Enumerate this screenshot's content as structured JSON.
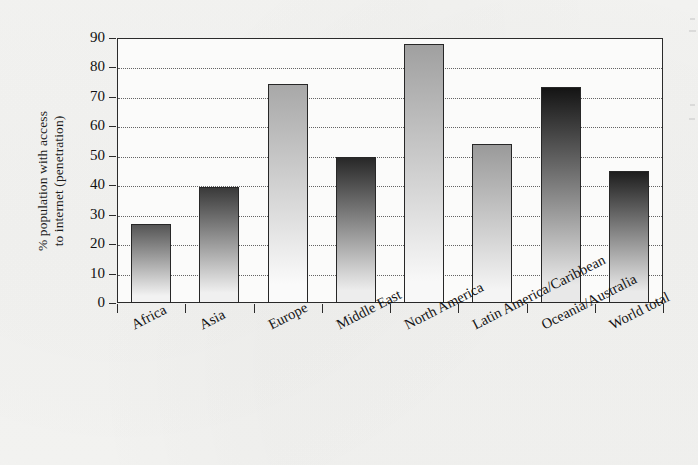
{
  "chart_data": {
    "type": "bar",
    "title": "",
    "xlabel": "",
    "ylabel": "% population with access to internet (penetration)",
    "ylabel_line1": "% population with access",
    "ylabel_line2": "to internet (penetration)",
    "categories": [
      "Africa",
      "Asia",
      "Europe",
      "Middle East",
      "North America",
      "Latin America/Caribbean",
      "Oceania/Australia",
      "World total"
    ],
    "values": [
      27,
      39.5,
      74.5,
      49.5,
      88,
      54,
      73.5,
      45
    ],
    "ylim": [
      0,
      90
    ],
    "ytick_values": [
      0,
      10,
      20,
      30,
      40,
      50,
      60,
      70,
      80,
      90
    ],
    "ytick_labels": [
      "0",
      "10",
      "20",
      "30",
      "40",
      "50",
      "60",
      "70",
      "80",
      "90"
    ],
    "grid": "horizontal-dotted",
    "legend": "none",
    "bar_fill": "vertical-gradient-dark-top-to-light-bottom",
    "bar_shades": [
      {
        "category": "Africa",
        "top": "#555555",
        "bottom": "#f2f2f2"
      },
      {
        "category": "Asia",
        "top": "#3a3a3a",
        "bottom": "#f0f0f0"
      },
      {
        "category": "Europe",
        "top": "#a8a8a8",
        "bottom": "#fafafa"
      },
      {
        "category": "Middle East",
        "top": "#282828",
        "bottom": "#ededed"
      },
      {
        "category": "North America",
        "top": "#a0a0a0",
        "bottom": "#f8f8f8"
      },
      {
        "category": "Latin America/Caribbean",
        "top": "#9a9a9a",
        "bottom": "#f4f4f4"
      },
      {
        "category": "Oceania/Australia",
        "top": "#141414",
        "bottom": "#e8e8e8"
      },
      {
        "category": "World total",
        "top": "#1e1e1e",
        "bottom": "#eaeaea"
      }
    ],
    "axis_color": "#2b2b2b",
    "background_color": "#f3f3f1",
    "plot_background_color": "#fbfbfa"
  }
}
